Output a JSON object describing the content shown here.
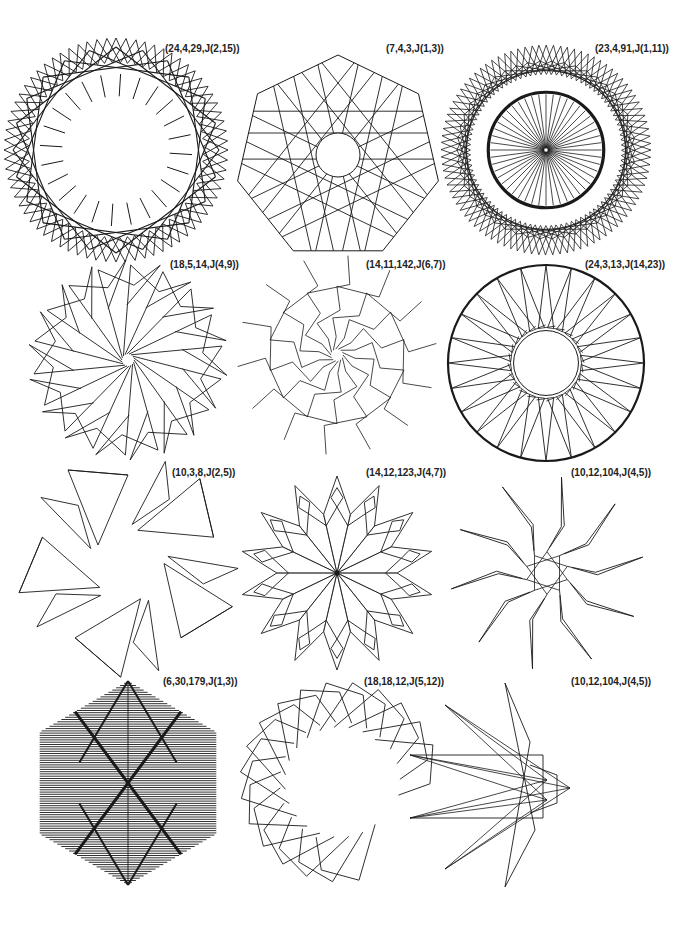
{
  "figures": [
    {
      "label": "(24,4,29,J(2,15))",
      "cx": 116,
      "cy": 150,
      "r": 112,
      "n": 24,
      "type": "rosette_dense",
      "label_x": 165,
      "label_y": 43
    },
    {
      "label": "(7,4,3,J(1,3))",
      "cx": 338,
      "cy": 150,
      "r": 103,
      "n": 7,
      "type": "heptagon_web",
      "label_x": 386,
      "label_y": 43
    },
    {
      "label": "(23,4,91,J(1,11))",
      "cx": 546,
      "cy": 150,
      "r": 105,
      "n": 23,
      "type": "ring_spokes",
      "label_x": 595,
      "label_y": 43
    },
    {
      "label": "(18,5,14,J(4,9))",
      "cx": 128,
      "cy": 360,
      "r": 100,
      "n": 18,
      "type": "spiral_pinwheel",
      "label_x": 170,
      "label_y": 259
    },
    {
      "label": "(14,11,142,J(6,7))",
      "cx": 337,
      "cy": 355,
      "r": 100,
      "n": 14,
      "type": "zigzag_pinwheel",
      "label_x": 366,
      "label_y": 259
    },
    {
      "label": "(24,3,13,J(14,23))",
      "cx": 546,
      "cy": 363,
      "r": 98,
      "n": 24,
      "type": "wheel",
      "label_x": 585,
      "label_y": 259
    },
    {
      "label": "(10,3,8,J(2,5))",
      "cx": 128,
      "cy": 565,
      "r": 95,
      "n": 5,
      "type": "triangle_pinwheel",
      "label_x": 172,
      "label_y": 467
    },
    {
      "label": "(14,12,123,J(4,7))",
      "cx": 337,
      "cy": 573,
      "r": 97,
      "n": 14,
      "type": "snowflake",
      "label_x": 366,
      "label_y": 467
    },
    {
      "label": "(10,12,104,J(4,5))",
      "cx": 547,
      "cy": 573,
      "r": 97,
      "n": 10,
      "type": "star_spikes",
      "label_x": 571,
      "label_y": 467
    },
    {
      "label": "(6,30,179,J(1,3))",
      "cx": 128,
      "cy": 783,
      "r": 102,
      "n": 6,
      "type": "hatched_hexagon",
      "label_x": 163,
      "label_y": 676
    },
    {
      "label": "(18,18,12,J(5,12))",
      "cx": 340,
      "cy": 782,
      "r": 100,
      "n": 18,
      "type": "c_arc",
      "label_x": 364,
      "label_y": 676
    },
    {
      "label": "(10,12,104,J(4,5))",
      "cx": 545,
      "cy": 785,
      "r": 103,
      "n": 10,
      "type": "half_star",
      "label_x": 571,
      "label_y": 676
    }
  ],
  "colors": {
    "stroke": "#1a1a1a",
    "background": "#ffffff",
    "label": "#222222"
  }
}
